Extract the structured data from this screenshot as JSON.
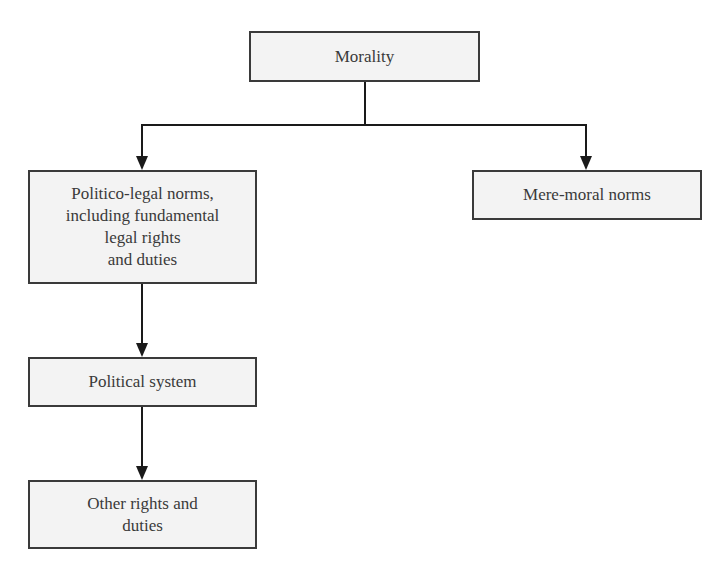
{
  "diagram": {
    "nodes": [
      {
        "id": "morality",
        "label": "Morality"
      },
      {
        "id": "politico_legal",
        "label": "Politico-legal norms,\nincluding fundamental\nlegal rights\nand duties"
      },
      {
        "id": "mere_moral",
        "label": "Mere-moral norms"
      },
      {
        "id": "political_system",
        "label": "Political system"
      },
      {
        "id": "other_rights",
        "label": "Other rights and\nduties"
      }
    ],
    "edges": [
      {
        "from": "morality",
        "to": "politico_legal"
      },
      {
        "from": "morality",
        "to": "mere_moral"
      },
      {
        "from": "politico_legal",
        "to": "political_system"
      },
      {
        "from": "political_system",
        "to": "other_rights"
      }
    ],
    "colors": {
      "box_fill": "#f3f3f3",
      "box_border": "#3a3a3a",
      "line": "#1a1a1a",
      "text": "#3a3a3a"
    }
  }
}
